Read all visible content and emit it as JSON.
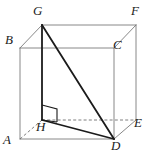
{
  "figure": {
    "type": "geometric-solid-diagram",
    "projection": "oblique",
    "background_color": "#ffffff",
    "thin_edge_color": "#7a7a7a",
    "hidden_edge_color": "#6f6f6f",
    "bold_edge_color": "#1b1b1b",
    "label_color": "#1b1b1b"
  },
  "vertices": [
    {
      "name": "A",
      "label": "A",
      "x": 20,
      "y": 139,
      "label_x": 3,
      "label_y": 139,
      "visible": true
    },
    {
      "name": "B",
      "label": "B",
      "x": 20,
      "y": 48,
      "label_x": 5,
      "label_y": 39,
      "visible": true
    },
    {
      "name": "C",
      "label": "C",
      "x": 114,
      "y": 48,
      "label_x": 113,
      "label_y": 44,
      "visible": true
    },
    {
      "name": "D",
      "label": "D",
      "x": 114,
      "y": 139,
      "label_x": 111,
      "label_y": 141,
      "visible": true
    },
    {
      "name": "E",
      "label": "E",
      "x": 136,
      "y": 120,
      "label_x": 134,
      "label_y": 119,
      "visible": true
    },
    {
      "name": "F",
      "label": "F",
      "x": 136,
      "y": 25,
      "label_x": 131,
      "label_y": 6,
      "visible": true
    },
    {
      "name": "G",
      "label": "G",
      "x": 42,
      "y": 25,
      "label_x": 33,
      "label_y": 6,
      "visible": true
    },
    {
      "name": "H",
      "label": "H",
      "x": 42,
      "y": 120,
      "label_x": 36,
      "label_y": 121,
      "visible": true
    }
  ],
  "edges": [
    {
      "name": "edge-A-B",
      "from": "A",
      "to": "B",
      "style": "solid-thin"
    },
    {
      "name": "edge-B-C",
      "from": "B",
      "to": "C",
      "style": "solid-thin"
    },
    {
      "name": "edge-C-D",
      "from": "C",
      "to": "D",
      "style": "solid-thin"
    },
    {
      "name": "edge-A-D",
      "from": "A",
      "to": "D",
      "style": "solid-thin"
    },
    {
      "name": "edge-B-G",
      "from": "B",
      "to": "G",
      "style": "solid-thin"
    },
    {
      "name": "edge-C-F",
      "from": "C",
      "to": "F",
      "style": "solid-thin"
    },
    {
      "name": "edge-D-E",
      "from": "D",
      "to": "E",
      "style": "solid-thin"
    },
    {
      "name": "edge-G-F",
      "from": "G",
      "to": "F",
      "style": "solid-thin"
    },
    {
      "name": "edge-F-E",
      "from": "F",
      "to": "E",
      "style": "solid-thin"
    },
    {
      "name": "edge-A-H",
      "from": "A",
      "to": "H",
      "style": "dashed-hidden"
    },
    {
      "name": "edge-H-E",
      "from": "H",
      "to": "E",
      "style": "dashed-hidden"
    },
    {
      "name": "edge-G-H",
      "from": "G",
      "to": "H",
      "style": "solid-bold"
    },
    {
      "name": "edge-G-D",
      "from": "G",
      "to": "D",
      "style": "solid-bold"
    },
    {
      "name": "edge-H-D",
      "from": "H",
      "to": "D",
      "style": "solid-bold"
    }
  ],
  "markers": [
    {
      "name": "right-angle-at-H",
      "at_vertex": "H",
      "type": "right-angle-square",
      "points": "42,105 57,109 57,122 42,120"
    }
  ],
  "highlighted_triangle": {
    "name": "triangle-GHD",
    "vertices": [
      "G",
      "H",
      "D"
    ],
    "right_angle_at": "H"
  }
}
